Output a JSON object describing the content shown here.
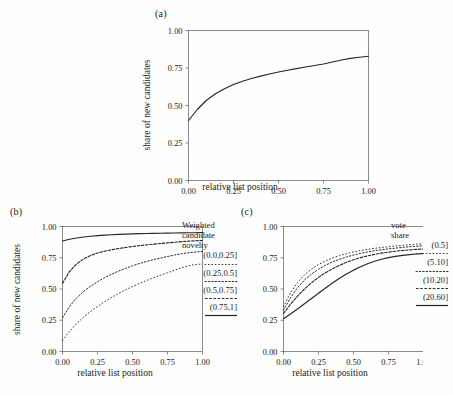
{
  "figure": {
    "background": "#fefefe",
    "line_color": "#262626",
    "axis_color": "#5a5a5a"
  },
  "panels": [
    {
      "label": "(a)",
      "xlabel": "relative list position",
      "ylabel": "share of new candidates",
      "xticks": [
        "0.00",
        "0.25",
        "0.50",
        "0.75",
        "1.00"
      ],
      "yticks": [
        "0.00",
        "0.25",
        "0.50",
        "0.75",
        "1.00"
      ]
    },
    {
      "label": "(b)",
      "xlabel": "relative list position",
      "ylabel": "share of new candidates",
      "xticks": [
        "0.00",
        "0.25",
        "0.50",
        "0.75",
        "1.00"
      ],
      "yticks": [
        "0.00",
        "0.25",
        "0.50",
        "0.75",
        "1.00"
      ],
      "legend_title_lines": [
        "Weighted",
        "candidate",
        "novelty"
      ],
      "legend_items": [
        "(0.0,0.25]",
        "(0.25,0.5]",
        "(0.5,0.75]",
        "(0.75,1]"
      ]
    },
    {
      "label": "(c)",
      "xlabel": "relative list position",
      "ylabel": "",
      "xticks": [
        "0.00",
        "0.25",
        "0.50",
        "0.75",
        "1.00"
      ],
      "yticks": [
        "0.00",
        "0.25",
        "0.50",
        "0.75",
        "1.00"
      ],
      "legend_title_lines": [
        "vote",
        "share"
      ],
      "legend_items": [
        "(0.5]",
        "(5.10]",
        "(10.20]",
        "(20.60]"
      ]
    }
  ],
  "chart_data": [
    {
      "type": "line",
      "panel": "(a)",
      "title": "(a)",
      "xlabel": "relative list position",
      "ylabel": "share of new candidates",
      "xlim": [
        0.0,
        1.0
      ],
      "ylim": [
        0.0,
        1.0
      ],
      "xticks": [
        0.0,
        0.25,
        0.5,
        0.75,
        1.0
      ],
      "yticks": [
        0.0,
        0.25,
        0.5,
        0.75,
        1.0
      ],
      "grid": false,
      "legend": "none",
      "series": [
        {
          "name": "all candidates",
          "style": "solid",
          "x": [
            0.0,
            0.05,
            0.1,
            0.15,
            0.2,
            0.25,
            0.3,
            0.35,
            0.4,
            0.45,
            0.5,
            0.55,
            0.6,
            0.65,
            0.7,
            0.75,
            0.8,
            0.85,
            0.9,
            0.95,
            1.0
          ],
          "y": [
            0.4,
            0.475,
            0.535,
            0.578,
            0.612,
            0.64,
            0.662,
            0.68,
            0.696,
            0.71,
            0.723,
            0.735,
            0.746,
            0.757,
            0.767,
            0.777,
            0.79,
            0.803,
            0.814,
            0.822,
            0.828
          ]
        }
      ]
    },
    {
      "type": "line",
      "panel": "(b)",
      "title": "(b)",
      "xlabel": "relative list position",
      "ylabel": "share of new candidates",
      "xlim": [
        0.0,
        1.0
      ],
      "ylim": [
        0.0,
        1.0
      ],
      "xticks": [
        0.0,
        0.25,
        0.5,
        0.75,
        1.0
      ],
      "yticks": [
        0.0,
        0.25,
        0.5,
        0.75,
        1.0
      ],
      "grid": false,
      "legend": "right",
      "legend_title": "Weighted candidate novelty",
      "series": [
        {
          "name": "(0.0,0.25]",
          "style": "dotted-fine",
          "x": [
            0.0,
            0.05,
            0.1,
            0.15,
            0.2,
            0.25,
            0.3,
            0.35,
            0.4,
            0.45,
            0.5,
            0.55,
            0.6,
            0.65,
            0.7,
            0.75,
            0.8,
            0.85,
            0.9,
            0.95,
            1.0
          ],
          "y": [
            0.09,
            0.16,
            0.222,
            0.275,
            0.32,
            0.36,
            0.398,
            0.432,
            0.464,
            0.493,
            0.52,
            0.545,
            0.568,
            0.59,
            0.61,
            0.63,
            0.65,
            0.67,
            0.686,
            0.696,
            0.7
          ]
        },
        {
          "name": "(0.25,0.5]",
          "style": "dotted",
          "x": [
            0.0,
            0.05,
            0.1,
            0.15,
            0.2,
            0.25,
            0.3,
            0.35,
            0.4,
            0.45,
            0.5,
            0.55,
            0.6,
            0.65,
            0.7,
            0.75,
            0.8,
            0.85,
            0.9,
            0.95,
            1.0
          ],
          "y": [
            0.27,
            0.36,
            0.428,
            0.48,
            0.522,
            0.558,
            0.59,
            0.618,
            0.643,
            0.665,
            0.686,
            0.704,
            0.72,
            0.735,
            0.748,
            0.76,
            0.772,
            0.782,
            0.79,
            0.796,
            0.8
          ]
        },
        {
          "name": "(0.5,0.75]",
          "style": "dashed",
          "x": [
            0.0,
            0.05,
            0.1,
            0.15,
            0.2,
            0.25,
            0.3,
            0.35,
            0.4,
            0.45,
            0.5,
            0.55,
            0.6,
            0.65,
            0.7,
            0.75,
            0.8,
            0.85,
            0.9,
            0.95,
            1.0
          ],
          "y": [
            0.545,
            0.64,
            0.7,
            0.74,
            0.768,
            0.788,
            0.802,
            0.814,
            0.824,
            0.832,
            0.84,
            0.847,
            0.853,
            0.859,
            0.864,
            0.869,
            0.874,
            0.879,
            0.883,
            0.886,
            0.888
          ]
        },
        {
          "name": "(0.75,1]",
          "style": "solid",
          "x": [
            0.0,
            0.05,
            0.1,
            0.15,
            0.2,
            0.25,
            0.3,
            0.35,
            0.4,
            0.45,
            0.5,
            0.55,
            0.6,
            0.65,
            0.7,
            0.75,
            0.8,
            0.85,
            0.9,
            0.95,
            1.0
          ],
          "y": [
            0.884,
            0.898,
            0.908,
            0.916,
            0.922,
            0.927,
            0.931,
            0.934,
            0.937,
            0.939,
            0.941,
            0.943,
            0.944,
            0.945,
            0.946,
            0.947,
            0.948,
            0.949,
            0.95,
            0.95,
            0.951
          ]
        }
      ]
    },
    {
      "type": "line",
      "panel": "(c)",
      "title": "(c)",
      "xlabel": "relative list position",
      "ylabel": "",
      "xlim": [
        0.0,
        1.0
      ],
      "ylim": [
        0.0,
        1.0
      ],
      "xticks": [
        0.0,
        0.25,
        0.5,
        0.75,
        1.0
      ],
      "yticks": [
        0.0,
        0.25,
        0.5,
        0.75,
        1.0
      ],
      "grid": false,
      "legend": "right",
      "legend_title": "vote share",
      "series": [
        {
          "name": "(0.5]",
          "style": "dotted-fine",
          "x": [
            0.0,
            0.05,
            0.1,
            0.15,
            0.2,
            0.25,
            0.3,
            0.35,
            0.4,
            0.45,
            0.5,
            0.55,
            0.6,
            0.65,
            0.7,
            0.75,
            0.8,
            0.85,
            0.9,
            0.95,
            1.0
          ],
          "y": [
            0.36,
            0.47,
            0.552,
            0.614,
            0.66,
            0.696,
            0.724,
            0.748,
            0.767,
            0.783,
            0.796,
            0.807,
            0.817,
            0.825,
            0.832,
            0.838,
            0.844,
            0.849,
            0.854,
            0.858,
            0.862
          ]
        },
        {
          "name": "(5.10]",
          "style": "dotted",
          "x": [
            0.0,
            0.05,
            0.1,
            0.15,
            0.2,
            0.25,
            0.3,
            0.35,
            0.4,
            0.45,
            0.5,
            0.55,
            0.6,
            0.65,
            0.7,
            0.75,
            0.8,
            0.85,
            0.9,
            0.95,
            1.0
          ],
          "y": [
            0.33,
            0.43,
            0.51,
            0.572,
            0.62,
            0.658,
            0.69,
            0.716,
            0.738,
            0.756,
            0.772,
            0.785,
            0.796,
            0.806,
            0.814,
            0.821,
            0.827,
            0.833,
            0.838,
            0.842,
            0.846
          ]
        },
        {
          "name": "(10.20]",
          "style": "dashed",
          "x": [
            0.0,
            0.05,
            0.1,
            0.15,
            0.2,
            0.25,
            0.3,
            0.35,
            0.4,
            0.45,
            0.5,
            0.55,
            0.6,
            0.65,
            0.7,
            0.75,
            0.8,
            0.85,
            0.9,
            0.95,
            1.0
          ],
          "y": [
            0.305,
            0.378,
            0.443,
            0.5,
            0.55,
            0.593,
            0.63,
            0.662,
            0.69,
            0.714,
            0.734,
            0.751,
            0.765,
            0.777,
            0.787,
            0.795,
            0.802,
            0.808,
            0.813,
            0.817,
            0.82
          ]
        },
        {
          "name": "(20.60]",
          "style": "solid",
          "x": [
            0.0,
            0.05,
            0.1,
            0.15,
            0.2,
            0.25,
            0.3,
            0.35,
            0.4,
            0.45,
            0.5,
            0.55,
            0.6,
            0.65,
            0.7,
            0.75,
            0.8,
            0.85,
            0.9,
            0.95,
            1.0
          ],
          "y": [
            0.262,
            0.3,
            0.34,
            0.382,
            0.424,
            0.466,
            0.508,
            0.548,
            0.586,
            0.62,
            0.651,
            0.678,
            0.702,
            0.722,
            0.738,
            0.751,
            0.761,
            0.769,
            0.775,
            0.78,
            0.783
          ]
        }
      ]
    }
  ]
}
